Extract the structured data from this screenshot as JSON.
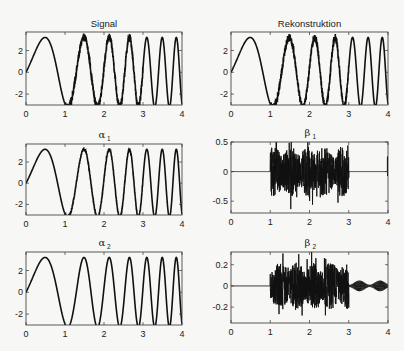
{
  "chart_data": [
    {
      "id": "signal",
      "type": "line",
      "title": "Signal",
      "title_greek": "",
      "title_sub": "",
      "xlabel": "",
      "ylabel": "",
      "xlim": [
        0,
        4
      ],
      "ylim": [
        -3,
        3.7
      ],
      "xticks": [
        0,
        1,
        2,
        3,
        4
      ],
      "xticklabels": [
        "0",
        "1",
        "2",
        "3",
        "4"
      ],
      "yticks": [
        -2,
        0,
        2
      ],
      "yticklabels": [
        "-2",
        "0",
        "2"
      ],
      "grid": false,
      "description": "Chirp-like sinusoid (amplitude ~3, increasing frequency) with small noise burst between t=1 and t=3",
      "model": {
        "kind": "chirp",
        "amp": 3.2,
        "noise": 0.35,
        "noise_from": 1,
        "noise_to": 3,
        "tail_noise": 0
      }
    },
    {
      "id": "rekonstruktion",
      "type": "line",
      "title": "Rekonstruktion",
      "title_greek": "",
      "title_sub": "",
      "xlim": [
        0,
        4
      ],
      "ylim": [
        -3,
        3.7
      ],
      "xticks": [
        0,
        1,
        2,
        3,
        4
      ],
      "xticklabels": [
        "0",
        "1",
        "2",
        "3",
        "4"
      ],
      "yticks": [
        -2,
        0,
        2
      ],
      "yticklabels": [
        "-2",
        "0",
        "2"
      ],
      "grid": false,
      "description": "Reconstruction of the signal; visually identical to Signal",
      "model": {
        "kind": "chirp",
        "amp": 3.2,
        "noise": 0.35,
        "noise_from": 1,
        "noise_to": 3,
        "tail_noise": 0
      }
    },
    {
      "id": "alpha1",
      "type": "line",
      "title": "",
      "title_greek": "α",
      "title_sub": "1",
      "xlim": [
        0,
        4
      ],
      "ylim": [
        -3,
        3.7
      ],
      "xticks": [
        0,
        1,
        2,
        3,
        4
      ],
      "xticklabels": [
        "0",
        "1",
        "2",
        "3",
        "4"
      ],
      "yticks": [
        -2,
        0,
        2
      ],
      "yticklabels": [
        "-2",
        "0",
        "2"
      ],
      "grid": false,
      "description": "Smooth chirp component (approximation level 1), slight residual noise",
      "model": {
        "kind": "chirp",
        "amp": 3.2,
        "noise": 0.12,
        "noise_from": 1,
        "noise_to": 3,
        "tail_noise": 0
      }
    },
    {
      "id": "beta1",
      "type": "line",
      "title": "",
      "title_greek": "β",
      "title_sub": "1",
      "xlim": [
        0,
        4
      ],
      "ylim": [
        -0.7,
        0.5
      ],
      "xticks": [
        0,
        1,
        2,
        3,
        4
      ],
      "xticklabels": [
        "0",
        "1",
        "2",
        "3",
        "4"
      ],
      "yticks": [
        -0.5,
        0,
        0.5
      ],
      "yticklabels": [
        "-0.5",
        "0",
        "0.5"
      ],
      "grid": false,
      "description": "Detail coefficients level 1: zero outside [1,3], dense noise burst amplitude ~0.4-0.5 inside, small spike at t=4",
      "model": {
        "kind": "noise",
        "amp": 0.42,
        "noise_from": 1,
        "noise_to": 3,
        "tail_amp": 0.0,
        "edge_spike": 0.25
      }
    },
    {
      "id": "alpha2",
      "type": "line",
      "title": "",
      "title_greek": "α",
      "title_sub": "2",
      "xlim": [
        0,
        4
      ],
      "ylim": [
        -3,
        3.7
      ],
      "xticks": [
        0,
        1,
        2,
        3,
        4
      ],
      "xticklabels": [
        "0",
        "1",
        "2",
        "3",
        "4"
      ],
      "yticks": [
        -2,
        0,
        2
      ],
      "yticklabels": [
        "-2",
        "0",
        "2"
      ],
      "grid": false,
      "description": "Smooth chirp component (approximation level 2), noise removed",
      "model": {
        "kind": "chirp",
        "amp": 3.2,
        "noise": 0.0,
        "noise_from": 1,
        "noise_to": 3,
        "tail_noise": 0
      }
    },
    {
      "id": "beta2",
      "type": "line",
      "title": "",
      "title_greek": "β",
      "title_sub": "2",
      "xlim": [
        0,
        4
      ],
      "ylim": [
        -0.35,
        0.32
      ],
      "xticks": [
        0,
        1,
        2,
        3,
        4
      ],
      "xticklabels": [
        "0",
        "1",
        "2",
        "3",
        "4"
      ],
      "yticks": [
        -0.2,
        0,
        0.2
      ],
      "yticklabels": [
        "-0.2",
        "0",
        "0.2"
      ],
      "grid": false,
      "description": "Detail coefficients level 2: zero before t=1, noise burst ~±0.25 in [1,3] with spikes to ±0.33, small oscillation ~±0.05 in (3,4]",
      "model": {
        "kind": "noise",
        "amp": 0.22,
        "noise_from": 1,
        "noise_to": 3,
        "tail_amp": 0.05,
        "edge_spike": 0
      }
    }
  ],
  "layout": {
    "panels": [
      {
        "x": 26,
        "y": 32,
        "w": 156,
        "h": 73
      },
      {
        "x": 231,
        "y": 32,
        "w": 157,
        "h": 73
      },
      {
        "x": 26,
        "y": 144,
        "w": 156,
        "h": 71
      },
      {
        "x": 231,
        "y": 142,
        "w": 157,
        "h": 71
      },
      {
        "x": 26,
        "y": 252,
        "w": 156,
        "h": 73
      },
      {
        "x": 231,
        "y": 252,
        "w": 157,
        "h": 71
      }
    ],
    "line_color": "#111111",
    "axis_color": "#333333",
    "background": "#f7f7f5"
  }
}
